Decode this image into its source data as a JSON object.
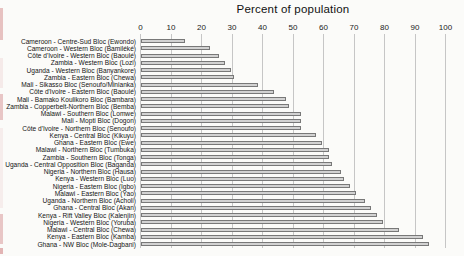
{
  "chart_data": {
    "type": "bar",
    "orientation": "horizontal",
    "title": "Percent of population",
    "xlabel": "Percent of population",
    "ylabel": "",
    "xlim": [
      0,
      100
    ],
    "x_ticks": [
      0,
      10,
      20,
      30,
      40,
      50,
      60,
      70,
      80,
      90,
      100
    ],
    "grid": true,
    "legend": false,
    "categories": [
      "Cameroon - Centre-Sud Bloc (Ewondo)",
      "Cameroon - Western Bloc (Bamiléké)",
      "Côte d'Ivoire - Western Bloc (Baoulé)",
      "Zambia - Western Bloc (Lozi)",
      "Uganda - Western Bloc (Banyankore)",
      "Zambia - Eastern Bloc (Chewa)",
      "Mali - Sikasso Bloc (Senoufo/Minianka)",
      "Côte d'Ivoire - Eastern Bloc (Baoulé)",
      "Mali - Bamako Koulikoro Bloc (Bambara)",
      "Zambia - Copperbelt-Northern Bloc (Bemba)",
      "Malawi - Southern Bloc (Lomwe)",
      "Mali - Mopti Bloc (Dogon)",
      "Côte d'Ivoire - Northern Bloc (Senoufo)",
      "Kenya - Central Bloc (Kikuyu)",
      "Ghana - Eastern Bloc (Ewe)",
      "Malawi - Northern Bloc (Tumbuka)",
      "Zambia - Southern Bloc (Tonga)",
      "Uganda - Central Opposition Bloc (Baganda)",
      "Nigeria - Northern Bloc (Hausa)",
      "Kenya - Western Bloc (Luo)",
      "Nigeria - Eastern Bloc (Igbo)",
      "Malawi - Eastern Bloc (Yao)",
      "Uganda - Northern Bloc (Acholi)",
      "Ghana - Central Bloc (Akan)",
      "Kenya - Rift Valley Bloc (Kalenjin)",
      "Nigeria - Western Bloc (Yoruba)",
      "Malawi - Central Bloc (Chewa)",
      "Kenya - Eastern Bloc (Kamba)",
      "Ghana - NW Bloc (Mole-Dagbani)"
    ],
    "values": [
      14,
      22,
      25,
      27,
      29,
      30,
      38,
      43,
      47,
      48,
      52,
      52,
      52,
      57,
      59,
      61,
      61,
      62,
      65,
      66,
      68,
      70,
      73,
      75,
      77,
      79,
      84,
      92,
      94
    ],
    "colors": {
      "bar_fill": "#d2d2d2",
      "bar_border": "#787878",
      "gridline": "#c6c6c6",
      "text": "#141414",
      "background": "#fbfbf9",
      "page_edge_mark": "#dca3a3"
    }
  }
}
